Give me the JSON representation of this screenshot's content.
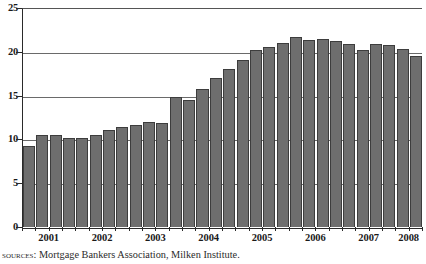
{
  "chart_data": {
    "type": "bar",
    "title": "",
    "subtitle": "",
    "xlabel": "",
    "ylabel": "",
    "ylim": [
      0,
      25
    ],
    "y_ticks": [
      0,
      5,
      10,
      15,
      20,
      25
    ],
    "grid": true,
    "legend": null,
    "bar_color": "#6e6e6e",
    "bar_edge_color": "#3d3d3d",
    "axis_color": "#2a2a2a",
    "gridline_color": "#6a6a6a",
    "frequency": "quarterly",
    "x_tick_labels": [
      "2001",
      "2002",
      "2003",
      "2004",
      "2005",
      "2006",
      "2007",
      "2008"
    ],
    "categories": [
      "2001 Q1",
      "2001 Q2",
      "2001 Q3",
      "2001 Q4",
      "2002 Q1",
      "2002 Q2",
      "2002 Q3",
      "2002 Q4",
      "2003 Q1",
      "2003 Q2",
      "2003 Q3",
      "2003 Q4",
      "2004 Q1",
      "2004 Q2",
      "2004 Q3",
      "2004 Q4",
      "2005 Q1",
      "2005 Q2",
      "2005 Q3",
      "2005 Q4",
      "2006 Q1",
      "2006 Q2",
      "2006 Q3",
      "2006 Q4",
      "2007 Q1",
      "2007 Q2",
      "2007 Q3",
      "2007 Q4",
      "2008 Q1",
      "2008 Q2"
    ],
    "values": [
      9.3,
      10.5,
      10.5,
      10.2,
      10.2,
      10.5,
      11.1,
      11.4,
      11.7,
      12.0,
      11.9,
      14.8,
      14.5,
      15.8,
      17.0,
      18.0,
      19.1,
      20.2,
      20.6,
      21.0,
      21.7,
      21.4,
      21.5,
      21.2,
      20.9,
      20.2,
      20.9,
      20.8,
      20.3,
      19.5
    ]
  },
  "source_note": {
    "label": "Sources",
    "separator": ": ",
    "text": "Mortgage Bankers Association, Milken Institute."
  }
}
